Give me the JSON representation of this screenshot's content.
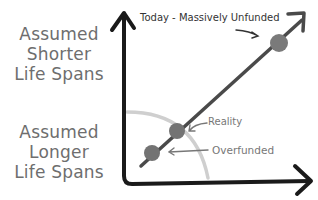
{
  "diagram": {
    "y_axis_labels": {
      "top": [
        "Assumed",
        "Shorter",
        "Life Spans"
      ],
      "bottom": [
        "Assumed",
        "Longer",
        "Life Spans"
      ]
    },
    "annotations": {
      "today": "Today - Massively Unfunded",
      "reality": "Reality",
      "overfunded": "Overfunded"
    },
    "points": [
      {
        "name": "today",
        "cx": 279,
        "cy": 43,
        "r": 9
      },
      {
        "name": "reality",
        "cx": 177,
        "cy": 131,
        "r": 8
      },
      {
        "name": "overfunded",
        "cx": 152,
        "cy": 153,
        "r": 8
      }
    ],
    "colors": {
      "axis": "#1a1a1a",
      "trend_line": "#4a4a4a",
      "point_fill": "#7a7a7a",
      "arc": "#c8c8c8",
      "label_text": "#6e6e6e"
    }
  }
}
